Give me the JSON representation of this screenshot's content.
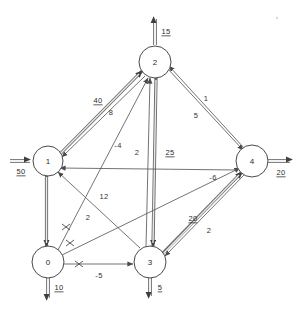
{
  "diagram": {
    "type": "min-cost-flow-network",
    "nodes": [
      {
        "id": "0",
        "label": "0",
        "cx": 48,
        "cy": 262
      },
      {
        "id": "1",
        "label": "1",
        "cx": 48,
        "cy": 161
      },
      {
        "id": "2",
        "label": "2",
        "cx": 155,
        "cy": 62
      },
      {
        "id": "3",
        "label": "3",
        "cx": 150,
        "cy": 262
      },
      {
        "id": "4",
        "label": "4",
        "cx": 252,
        "cy": 161
      }
    ],
    "external_flows": [
      {
        "name": "supply-node-1",
        "node": "1",
        "label": "50",
        "direction": "in",
        "side": "left"
      },
      {
        "name": "demand-node-2",
        "node": "2",
        "label": "15",
        "direction": "out",
        "side": "top"
      },
      {
        "name": "demand-node-4",
        "node": "4",
        "label": "20",
        "direction": "out",
        "side": "right"
      },
      {
        "name": "demand-node-0",
        "node": "0",
        "label": "10",
        "direction": "out",
        "side": "bottom"
      },
      {
        "name": "demand-node-3",
        "node": "3",
        "label": "5",
        "direction": "out",
        "side": "bottom"
      }
    ],
    "arcs": [
      {
        "name": "arc-1-to-2-flow",
        "from": "1",
        "to": "2",
        "label": "40",
        "label_kind": "flow",
        "style": "thick",
        "blocked": false
      },
      {
        "name": "arc-2-to-1-cost",
        "from": "2",
        "to": "1",
        "label": "8",
        "label_kind": "cost",
        "style": "thin",
        "blocked": false
      },
      {
        "name": "arc-0-to-2-cost",
        "from": "0",
        "to": "2",
        "label": "-4",
        "label_kind": "cost",
        "style": "thin",
        "blocked": true
      },
      {
        "name": "arc-3-to-2-cost",
        "from": "3",
        "to": "2",
        "label": "2",
        "label_kind": "cost",
        "style": "thin",
        "blocked": false
      },
      {
        "name": "arc-2-to-3-flow",
        "from": "2",
        "to": "3",
        "label": "25",
        "label_kind": "flow",
        "style": "thick",
        "blocked": false
      },
      {
        "name": "arc-2-to-4-cost",
        "from": "2",
        "to": "4",
        "label": "1",
        "label_kind": "cost",
        "style": "thin",
        "blocked": false
      },
      {
        "name": "arc-4-to-2-cost",
        "from": "4",
        "to": "2",
        "label": "5",
        "label_kind": "cost",
        "style": "thin",
        "blocked": false
      },
      {
        "name": "arc-0-to-1-flow",
        "from": "1",
        "to": "0",
        "label": "",
        "label_kind": "none",
        "style": "thick",
        "blocked": false
      },
      {
        "name": "arc-0-to-1-cost",
        "from": "0",
        "to": "1",
        "label": "12",
        "label_kind": "cost",
        "style": "thin",
        "blocked": true
      },
      {
        "name": "arc-0-to-4-cost",
        "from": "0",
        "to": "4",
        "label": "2",
        "label_kind": "cost",
        "style": "thin",
        "blocked": true
      },
      {
        "name": "arc-4-to-1-cost",
        "from": "4",
        "to": "1",
        "label": "-6",
        "label_kind": "cost",
        "style": "thin",
        "blocked": false
      },
      {
        "name": "arc-0-to-3-cost",
        "from": "0",
        "to": "3",
        "label": "-5",
        "label_kind": "cost",
        "style": "thin",
        "blocked": true
      },
      {
        "name": "arc-3-to-4-flow",
        "from": "3",
        "to": "4",
        "label": "20",
        "label_kind": "flow",
        "style": "thick",
        "blocked": false
      },
      {
        "name": "arc-4-to-3-cost",
        "from": "4",
        "to": "3",
        "label": "2",
        "label_kind": "cost",
        "style": "thin",
        "blocked": false
      }
    ],
    "labels": {
      "n0": "0",
      "n1": "1",
      "n2": "2",
      "n3": "3",
      "n4": "4",
      "supply_1": "50",
      "demand_2": "15",
      "demand_4": "20",
      "demand_0": "10",
      "demand_3": "5",
      "e_1_2_flow": "40",
      "e_2_1_cost": "8",
      "e_0_2_cost": "-4",
      "e_3_2_cost": "2",
      "e_2_3_flow": "25",
      "e_2_4_cost": "1",
      "e_4_2_cost": "5",
      "e_0_1_cost": "12",
      "e_0_4_cost": "2",
      "e_4_1_cost": "-6",
      "e_0_3_cost": "-5",
      "e_3_4_flow": "20",
      "e_4_3_cost": "2"
    },
    "colors": {
      "node_stroke": "#4a4a4a",
      "thin_arc": "#5a5a5a",
      "thick_arc": "#6a6a6a",
      "text": "#2b2b2b",
      "background": "#ffffff"
    }
  }
}
